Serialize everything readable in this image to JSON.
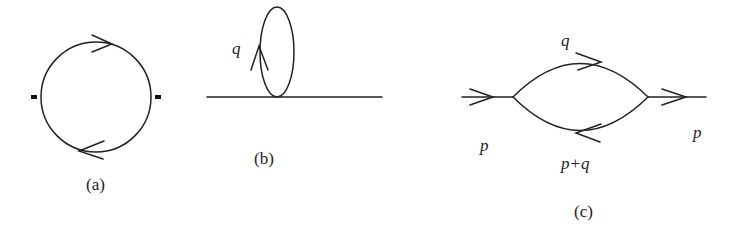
{
  "figure": {
    "panels": [
      {
        "id": "a",
        "caption": "(a)",
        "description": "one-loop bubble with two external insertions"
      },
      {
        "id": "b",
        "caption": "(b)",
        "description": "tadpole loop on a propagator line",
        "loop_label": "q"
      },
      {
        "id": "c",
        "caption": "(c)",
        "description": "self-energy bubble",
        "labels": {
          "incoming": "p",
          "outgoing": "p",
          "upper": "q",
          "lower": "p+q"
        }
      }
    ]
  },
  "style": {
    "stroke": "#222222",
    "background": "#ffffff"
  }
}
